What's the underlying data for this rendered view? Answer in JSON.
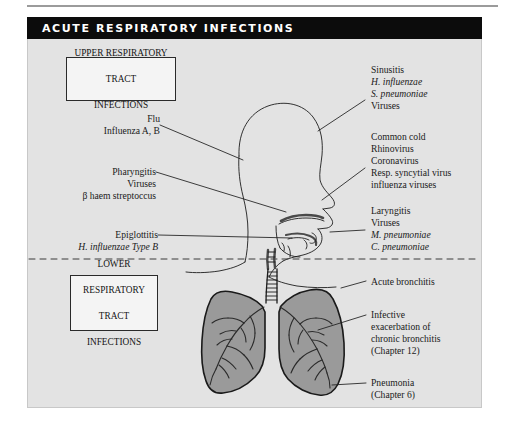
{
  "figure": {
    "title": "ACUTE RESPIRATORY INFECTIONS",
    "colors": {
      "title_bar": "#0c0c0c",
      "title_text": "#ffffff",
      "panel_bg": "#e3e3e3",
      "lung_fill": "#9a9a9a",
      "ink": "#1a1a1a"
    }
  },
  "boxes": {
    "upper": {
      "line1": "UPPER RESPIRATORY",
      "line2": "TRACT",
      "line3": "INFECTIONS"
    },
    "lower": {
      "line1": "LOWER",
      "line2": "RESPIRATORY",
      "line3": "TRACT",
      "line4": "INFECTIONS"
    }
  },
  "labels_left": [
    {
      "name": "flu",
      "lines": [
        {
          "text": "Flu",
          "italic": false
        },
        {
          "text": "Influenza A, B",
          "italic": false
        }
      ]
    },
    {
      "name": "pharyngitis",
      "lines": [
        {
          "text": "Pharyngitis",
          "italic": false
        },
        {
          "text": "Viruses",
          "italic": false
        },
        {
          "text": "β haem streptoccus",
          "italic": false
        }
      ]
    },
    {
      "name": "epiglottitis",
      "lines": [
        {
          "text": "Epiglottitis",
          "italic": false
        },
        {
          "text": "H. influenzae Type B",
          "italic": true
        }
      ]
    }
  ],
  "labels_right": [
    {
      "name": "sinusitis",
      "lines": [
        {
          "text": "Sinusitis",
          "italic": false
        },
        {
          "text": "H. influenzae",
          "italic": true
        },
        {
          "text": "S. pneumoniae",
          "italic": true
        },
        {
          "text": "Viruses",
          "italic": false
        }
      ]
    },
    {
      "name": "common-cold",
      "lines": [
        {
          "text": "Common cold",
          "italic": false
        },
        {
          "text": "Rhinovirus",
          "italic": false
        },
        {
          "text": "Coronavirus",
          "italic": false
        },
        {
          "text": "Resp. syncytial virus",
          "italic": false
        },
        {
          "text": "influenza viruses",
          "italic": false
        }
      ]
    },
    {
      "name": "laryngitis",
      "lines": [
        {
          "text": "Laryngitis",
          "italic": false
        },
        {
          "text": "Viruses",
          "italic": false
        },
        {
          "text": "M. pneumoniae",
          "italic": true
        },
        {
          "text": "C. pneumoniae",
          "italic": true
        }
      ]
    },
    {
      "name": "acute-bronchitis",
      "lines": [
        {
          "text": "Acute bronchitis",
          "italic": false
        }
      ]
    },
    {
      "name": "infective-exacerbation",
      "lines": [
        {
          "text": "Infective",
          "italic": false
        },
        {
          "text": "exacerbation of",
          "italic": false
        },
        {
          "text": "chronic bronchitis",
          "italic": false
        },
        {
          "text": "(Chapter 12)",
          "italic": false
        }
      ]
    },
    {
      "name": "pneumonia",
      "lines": [
        {
          "text": "Pneumonia",
          "italic": false
        },
        {
          "text": "(Chapter 6)",
          "italic": false
        }
      ]
    }
  ]
}
